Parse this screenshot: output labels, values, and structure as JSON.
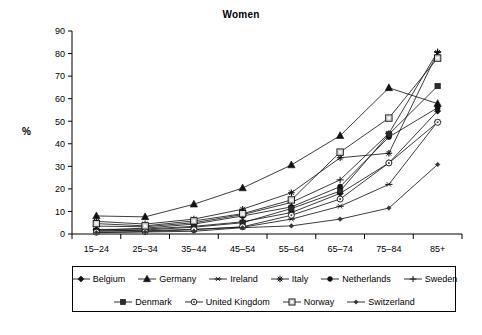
{
  "chart_data": {
    "type": "line",
    "title": "Women",
    "xlabel": "",
    "ylabel": "%",
    "ylim": [
      0,
      90
    ],
    "ytick_step": 10,
    "yticks": [
      0,
      10,
      20,
      30,
      40,
      50,
      60,
      70,
      80,
      90
    ],
    "grid": false,
    "legend_position": "bottom",
    "categories": [
      "15–24",
      "25–34",
      "35–44",
      "45–54",
      "55–64",
      "65–74",
      "75–84",
      "85+"
    ],
    "series": [
      {
        "name": "Belgium",
        "marker": "filled-diamond",
        "values": [
          2.0,
          2.2,
          3.4,
          5.4,
          9.5,
          18.0,
          31.5,
          54.5
        ]
      },
      {
        "name": "Germany",
        "marker": "filled-triangle",
        "values": [
          8.0,
          7.6,
          13.2,
          20.4,
          30.6,
          43.6,
          64.8,
          57.8
        ]
      },
      {
        "name": "Ireland",
        "marker": "asterisk",
        "values": [
          1.8,
          1.4,
          2.1,
          3.0,
          6.6,
          12.3,
          22.0,
          49.8
        ]
      },
      {
        "name": "Italy",
        "marker": "star",
        "values": [
          5.6,
          4.4,
          6.6,
          11.0,
          18.3,
          33.8,
          35.8,
          80.5
        ]
      },
      {
        "name": "Netherlands",
        "marker": "filled-circle",
        "values": [
          1.6,
          2.6,
          4.4,
          8.0,
          12.0,
          21.0,
          43.0,
          56.0
        ]
      },
      {
        "name": "Sweden",
        "marker": "plus",
        "values": [
          3.5,
          3.2,
          5.0,
          8.6,
          14.0,
          24.0,
          44.6,
          80.8
        ]
      },
      {
        "name": "Denmark",
        "marker": "filled-square",
        "values": [
          1.2,
          1.8,
          3.0,
          5.0,
          11.3,
          19.0,
          44.2,
          65.6
        ]
      },
      {
        "name": "United Kingdom",
        "marker": "open-circle",
        "values": [
          0.8,
          1.1,
          1.9,
          3.2,
          8.3,
          15.5,
          31.5,
          49.5
        ]
      },
      {
        "name": "Norway",
        "marker": "open-square",
        "values": [
          4.6,
          3.6,
          5.8,
          9.0,
          15.1,
          36.3,
          51.4,
          78.0
        ]
      },
      {
        "name": "Switzerland",
        "marker": "small-diamond",
        "values": [
          0.6,
          0.9,
          1.2,
          2.8,
          3.6,
          6.6,
          11.5,
          30.8
        ]
      }
    ]
  },
  "legend": {
    "rows": [
      [
        "Belgium",
        "Germany",
        "Ireland",
        "Italy",
        "Netherlands",
        "Sweden"
      ],
      [
        "Denmark",
        "United Kingdom",
        "Norway",
        "Switzerland"
      ]
    ]
  },
  "colors": {
    "line": "#1a1a1a",
    "axis": "#000000",
    "background": "#ffffff"
  }
}
